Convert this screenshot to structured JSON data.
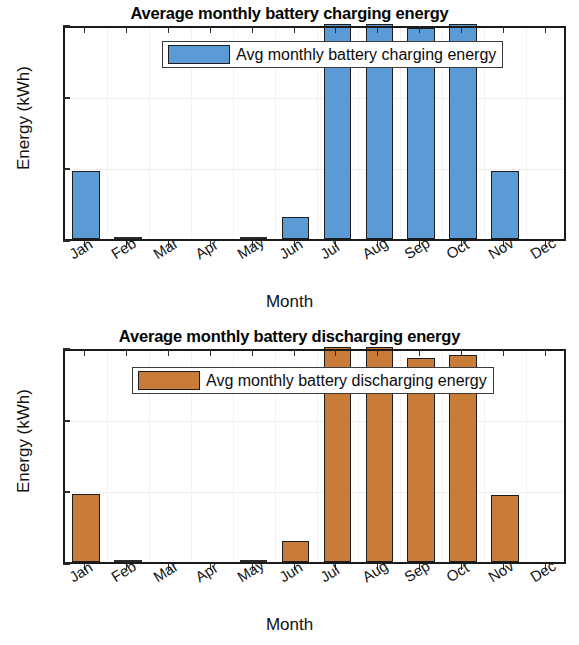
{
  "figure": {
    "background": "#ffffff"
  },
  "charts": [
    {
      "id": "charging",
      "title": "Average monthly battery charging energy",
      "xlabel": "Month",
      "ylabel": "Energy (kWh)",
      "legend_label": "Avg monthly battery charging energy",
      "bar_color": "#5B9BD5",
      "edge_color": "#1d1d1d",
      "yticks": [
        "0",
        "2",
        "4",
        "6"
      ],
      "categories": [
        "Jan",
        "Feb",
        "Mar",
        "Apr",
        "May",
        "Jun",
        "Jul",
        "Aug",
        "Sep",
        "Oct",
        "Nov",
        "Dec"
      ],
      "values": [
        1.9,
        0.02,
        0,
        0,
        0.03,
        0.62,
        6.2,
        6.15,
        5.9,
        6.15,
        1.9,
        0
      ]
    },
    {
      "id": "discharging",
      "title": "Average monthly battery discharging energy",
      "xlabel": "Month",
      "ylabel": "Energy (kWh)",
      "legend_label": "Avg monthly battery discharging energy",
      "bar_color": "#C97C38",
      "edge_color": "#1d1d1d",
      "yticks": [
        "0",
        "2",
        "4",
        "6"
      ],
      "categories": [
        "Jan",
        "Feb",
        "Mar",
        "Apr",
        "May",
        "Jun",
        "Jul",
        "Aug",
        "Sep",
        "Oct",
        "Nov",
        "Dec"
      ],
      "values": [
        1.9,
        0.02,
        0,
        0,
        0.03,
        0.58,
        6.2,
        6.1,
        5.7,
        5.78,
        1.87,
        0
      ]
    }
  ],
  "chart_data": [
    {
      "type": "bar",
      "title": "Average monthly battery charging energy",
      "xlabel": "Month",
      "ylabel": "Energy (kWh)",
      "ylim": [
        0,
        6
      ],
      "yticks": [
        0,
        2,
        4,
        6
      ],
      "grid": true,
      "legend": "Avg monthly battery charging energy",
      "legend_position": "upper center",
      "color": "#5B9BD5",
      "categories": [
        "Jan",
        "Feb",
        "Mar",
        "Apr",
        "May",
        "Jun",
        "Jul",
        "Aug",
        "Sep",
        "Oct",
        "Nov",
        "Dec"
      ],
      "values": [
        1.9,
        0.02,
        0,
        0,
        0.03,
        0.62,
        6.2,
        6.15,
        5.9,
        6.15,
        1.9,
        0
      ],
      "notes": "Jul, Aug and Oct bars are clipped at the top of the 0-6 axis"
    },
    {
      "type": "bar",
      "title": "Average monthly battery discharging energy",
      "xlabel": "Month",
      "ylabel": "Energy (kWh)",
      "ylim": [
        0,
        6
      ],
      "yticks": [
        0,
        2,
        4,
        6
      ],
      "grid": true,
      "legend": "Avg monthly battery discharging energy",
      "legend_position": "upper center",
      "color": "#C97C38",
      "categories": [
        "Jan",
        "Feb",
        "Mar",
        "Apr",
        "May",
        "Jun",
        "Jul",
        "Aug",
        "Sep",
        "Oct",
        "Nov",
        "Dec"
      ],
      "values": [
        1.9,
        0.02,
        0,
        0,
        0.03,
        0.58,
        6.2,
        6.1,
        5.7,
        5.78,
        1.87,
        0
      ],
      "notes": "Jul and Aug bars are clipped at the top of the 0-6 axis"
    }
  ]
}
